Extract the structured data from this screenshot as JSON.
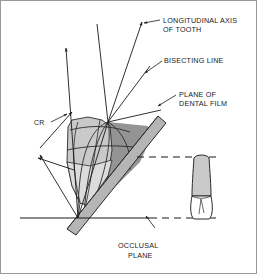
{
  "figure": {
    "background_color": "#ffffff",
    "border_color": "#9a9a9a",
    "line_color": "#1a1a1a",
    "tooth_fill": "#c9c9c9",
    "tooth_shadow_fill": "#8e8e8e",
    "film_fill": "#b5b5b5",
    "crown_fill": "#ffffff"
  },
  "labels": {
    "longitudinal_axis": {
      "line1": "LONGITUDINAL AXIS",
      "line2": "OF TOOTH"
    },
    "bisecting_line": {
      "line1": "BISECTING LINE"
    },
    "plane_of_dental_film": {
      "line1": "PLANE OF",
      "line2": "DENTAL FILM"
    },
    "occlusal_plane": {
      "line1": "OCCLUSAL",
      "line2": "PLANE"
    },
    "central_ray": {
      "line1": "CR"
    }
  }
}
